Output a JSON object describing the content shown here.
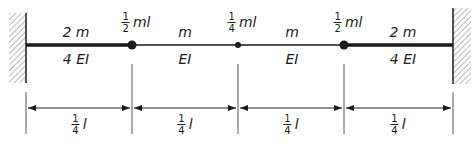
{
  "diagram": {
    "type": "fixed-fixed beam with lumped masses",
    "colors": {
      "ink": "#1a1a1a",
      "hatch": "#888888"
    },
    "supports": [
      {
        "side": "left",
        "type": "fixed-wall"
      },
      {
        "side": "right",
        "type": "fixed-wall"
      }
    ],
    "segments": [
      {
        "mass": "2 m",
        "stiffness": "4 EI",
        "thick": true
      },
      {
        "mass": "m",
        "stiffness": "EI",
        "thick": false
      },
      {
        "mass": "m",
        "stiffness": "EI",
        "thick": false
      },
      {
        "mass": "2 m",
        "stiffness": "4 EI",
        "thick": true
      }
    ],
    "point_masses": [
      {
        "num": "1",
        "den": "2",
        "suffix": "ml",
        "large": true
      },
      {
        "num": "1",
        "den": "4",
        "suffix": "ml",
        "large": false
      },
      {
        "num": "1",
        "den": "2",
        "suffix": "ml",
        "large": true
      }
    ],
    "dimensions": [
      {
        "num": "1",
        "den": "4",
        "suffix": "l"
      },
      {
        "num": "1",
        "den": "4",
        "suffix": "l"
      },
      {
        "num": "1",
        "den": "4",
        "suffix": "l"
      },
      {
        "num": "1",
        "den": "4",
        "suffix": "l"
      }
    ]
  }
}
